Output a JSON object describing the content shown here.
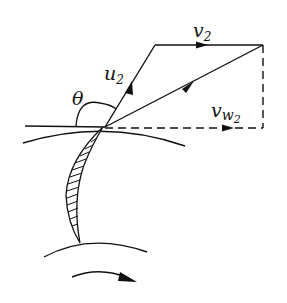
{
  "diagram": {
    "type": "velocity-triangle",
    "labels": {
      "v": "v",
      "v_sub": "2",
      "u": "u",
      "u_sub": "2",
      "theta": "θ",
      "vw": "v",
      "vw_sub": "w",
      "vw_subsub": "2"
    },
    "colors": {
      "ink": "#111111",
      "background": "#ffffff"
    }
  }
}
